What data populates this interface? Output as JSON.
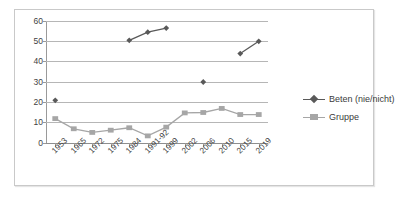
{
  "chart_data": {
    "type": "line",
    "title": "",
    "subtitle": "",
    "xlabel": "",
    "ylabel": "",
    "ylim": [
      0,
      60
    ],
    "ytick_labels": [
      "0",
      "10",
      "20",
      "30",
      "40",
      "50",
      "60"
    ],
    "ytick_values": [
      0,
      10,
      20,
      30,
      40,
      50,
      60
    ],
    "grid": true,
    "legend_position": "right",
    "categories": [
      "1953",
      "1965",
      "1972",
      "1975",
      "1984",
      "1991-92",
      "1999",
      "2002",
      "2006",
      "2010",
      "2015",
      "2019"
    ],
    "series": [
      {
        "name": "Beten (nie/nicht)",
        "color": "#595959",
        "marker": "diamond",
        "values": [
          21,
          null,
          null,
          null,
          50.5,
          54.5,
          56.5,
          null,
          30,
          null,
          44,
          50
        ]
      },
      {
        "name": "Gruppe",
        "color": "#a6a6a6",
        "marker": "square",
        "values": [
          12,
          7,
          5.2,
          6.3,
          7.5,
          3.5,
          7.8,
          14.8,
          15,
          17,
          14,
          14
        ]
      }
    ]
  },
  "legend": {
    "items": [
      {
        "label": "Beten (nie/nicht)",
        "marker": "diamond",
        "color": "#595959"
      },
      {
        "label": "Gruppe",
        "marker": "square",
        "color": "#a6a6a6"
      }
    ]
  },
  "colors": {
    "series_dark": "#595959",
    "series_light": "#a6a6a6",
    "gridline": "#b6b6b6",
    "axis": "#9a9a9a",
    "frame": "#c9c9c9",
    "text": "#3f3f3f",
    "background": "#ffffff"
  }
}
